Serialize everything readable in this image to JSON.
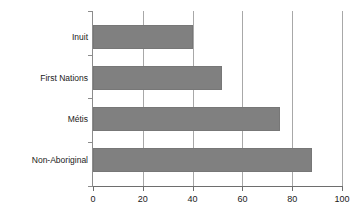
{
  "chart_data": {
    "type": "bar",
    "orientation": "horizontal",
    "title": "",
    "xlabel": "",
    "ylabel": "",
    "categories": [
      "Inuit",
      "First Nations",
      "Métis",
      "Non-Aboriginal"
    ],
    "values": [
      40,
      52,
      75,
      88
    ],
    "xlim": [
      0,
      100
    ],
    "xticks": [
      0,
      20,
      40,
      60,
      80,
      100
    ],
    "xtick_labels": [
      "0",
      "20",
      "40",
      "60",
      "80",
      "100"
    ],
    "grid": {
      "vertical": true,
      "horizontal": false
    },
    "legend": null,
    "series": [
      {
        "name": "",
        "color": "#808080",
        "values": [
          40,
          52,
          75,
          88
        ]
      }
    ],
    "colors": {
      "bar_fill": "#808080",
      "bar_stroke": "#777777",
      "gridline": "#a8a8a8",
      "axis": "#6e6e6e",
      "text": "#1a1a1a",
      "background": "#ffffff"
    }
  }
}
